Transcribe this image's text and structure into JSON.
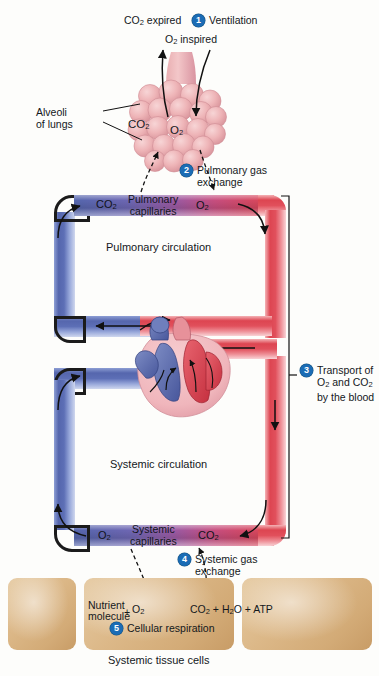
{
  "top_labels": {
    "co2_expired": "CO2 expired",
    "o2_inspired": "O2 inspired",
    "alveoli_line1": "Alveoli",
    "alveoli_line2": "of lungs",
    "alveoli_co2": "CO2",
    "alveoli_o2": "O2"
  },
  "steps": [
    {
      "number": "1",
      "label": "Ventilation"
    },
    {
      "number": "2",
      "label_line1": "Pulmonary gas",
      "label_line2": "exchange"
    },
    {
      "number": "3",
      "label_line1": "Transport of",
      "label_line2": "O2 and CO2",
      "label_line3": "by the blood"
    },
    {
      "number": "4",
      "label_line1": "Systemic gas",
      "label_line2": "exchange"
    },
    {
      "number": "5",
      "label": "Cellular respiration"
    }
  ],
  "pulmonary": {
    "capillaries_line1": "Pulmonary",
    "capillaries_line2": "capillaries",
    "left_gas": "CO2",
    "right_gas": "O2",
    "circulation_label": "Pulmonary circulation"
  },
  "systemic": {
    "capillaries_line1": "Systemic",
    "capillaries_line2": "capillaries",
    "left_gas": "O2",
    "right_gas": "CO2",
    "circulation_label": "Systemic circulation"
  },
  "tissue": {
    "caption": "Systemic tissue cells",
    "equation": {
      "reactant_line1": "Nutrient",
      "reactant_line2": "molecule",
      "plus1": "+",
      "reactant2": "O2",
      "products": "CO2 + H2O + ATP"
    }
  },
  "colors": {
    "oxygenated_blood": "#dd4551",
    "deoxygenated_blood": "#5566ad",
    "capillary_mix": "#9a5aa3",
    "alveoli_pink": "#e8a8ab",
    "tissue_tan": "#dcb888",
    "badge_blue": "#1b6cb5",
    "background": "#fdfdfb"
  }
}
